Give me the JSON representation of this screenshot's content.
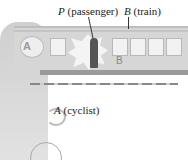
{
  "figure": {
    "labels": {
      "passenger": {
        "symbol": "P",
        "text": " (passenger)"
      },
      "train": {
        "symbol": "B",
        "text": " (train)"
      },
      "cyclist": {
        "symbol": "A",
        "text": " (cyclist)"
      },
      "train_side_letter": "B",
      "helmet_letter": "A"
    }
  }
}
